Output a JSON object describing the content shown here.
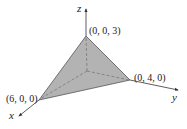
{
  "figure": {
    "type": "3d-tetrahedron-plane-diagram",
    "colors": {
      "face_fill": "#b3b3b3",
      "face_stroke": "#555555",
      "axis": "#333333",
      "hidden_line": "#6e6e6e",
      "background": "#ffffff"
    },
    "axes": {
      "x": {
        "label": "x"
      },
      "y": {
        "label": "y"
      },
      "z": {
        "label": "z"
      }
    },
    "vertices": [
      {
        "name": "z-intercept",
        "label": "(0, 0, 3)",
        "coords": [
          0,
          0,
          3
        ]
      },
      {
        "name": "y-intercept",
        "label": "(0, 4, 0)",
        "coords": [
          0,
          4,
          0
        ]
      },
      {
        "name": "x-intercept",
        "label": "(6, 0, 0)",
        "coords": [
          6,
          0,
          0
        ]
      }
    ]
  }
}
